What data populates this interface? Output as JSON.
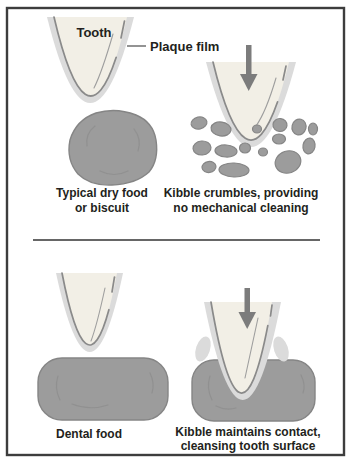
{
  "panels": {
    "top_left": {
      "tooth_label": "Tooth",
      "plaque_label": "Plaque film",
      "caption_line1": "Typical dry food",
      "caption_line2": "or biscuit"
    },
    "top_right": {
      "caption_line1": "Kibble crumbles, providing",
      "caption_line2": "no mechanical cleaning"
    },
    "bottom_left": {
      "caption": "Dental food"
    },
    "bottom_right": {
      "caption_line1": "Kibble maintains contact,",
      "caption_line2": "cleansing tooth surface"
    }
  },
  "colors": {
    "plaque_film": "#dbdbdb",
    "tooth": "#f2efe6",
    "tooth_outline": "#8a8a8a",
    "food": "#9c9c9c",
    "food_edge": "#858585",
    "arrow": "#7c7c7c",
    "text": "#231f20",
    "frame": "#3d3d3d",
    "divider": "#666666"
  }
}
